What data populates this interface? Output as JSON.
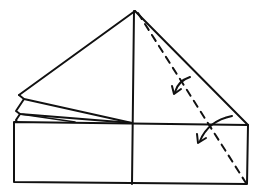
{
  "diagram": {
    "type": "origami-folding-step",
    "colors": {
      "line": "#111111",
      "background": "#ffffff"
    },
    "fold_line": {
      "style": "dashed",
      "kind": "valley-fold"
    },
    "arrows": [
      {
        "name": "fold-arrow-upper",
        "direction": "down-left"
      },
      {
        "name": "fold-arrow-lower",
        "direction": "down-left"
      }
    ],
    "layers_left": 3
  }
}
